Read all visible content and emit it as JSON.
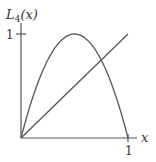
{
  "chart_data": {
    "type": "line",
    "title": "",
    "ylabel": "L_4(x)",
    "ylabel_display": {
      "base": "L",
      "sub": "4",
      "arg": "(x)"
    },
    "xlabel": "x",
    "xlim": [
      0,
      1
    ],
    "ylim": [
      0,
      1
    ],
    "x_ticks": [
      "1"
    ],
    "y_ticks": [
      "1"
    ],
    "grid": false,
    "legend": null,
    "series": [
      {
        "name": "L_4(x) = 4x(1-x)",
        "x": [
          0,
          0.1,
          0.2,
          0.3,
          0.4,
          0.5,
          0.6,
          0.7,
          0.8,
          0.9,
          1.0
        ],
        "y": [
          0,
          0.36,
          0.64,
          0.84,
          0.96,
          1.0,
          0.96,
          0.84,
          0.64,
          0.36,
          0
        ]
      },
      {
        "name": "y = x",
        "x": [
          0,
          1
        ],
        "y": [
          0,
          1
        ]
      }
    ],
    "intersection": {
      "x": 0.75,
      "y": 0.75
    }
  },
  "labels": {
    "y_axis_base": "L",
    "y_axis_sub": "4",
    "y_axis_arg": "(x)",
    "x_axis": "x",
    "x_tick_1": "1",
    "y_tick_1": "1"
  },
  "colors": {
    "curve": "#555555",
    "axis": "#555555",
    "text": "#333333"
  }
}
